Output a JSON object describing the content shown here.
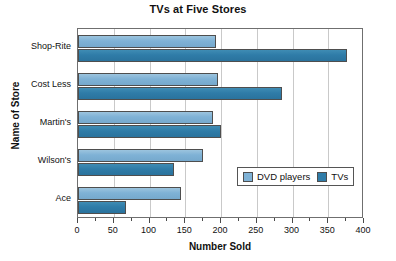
{
  "chart_data": {
    "type": "bar",
    "orientation": "horizontal",
    "title": "TVs at Five Stores",
    "xlabel": "Number Sold",
    "ylabel": "Name of Store",
    "categories": [
      "Shop-Rite",
      "Cost Less",
      "Martin's",
      "Wilson's",
      "Ace"
    ],
    "series": [
      {
        "name": "DVD players",
        "color": "#7FB2D6",
        "values": [
          193,
          196,
          189,
          175,
          144
        ]
      },
      {
        "name": "TVs",
        "color": "#2F7CA8",
        "values": [
          376,
          285,
          200,
          134,
          67
        ]
      }
    ],
    "xlim": [
      0,
      400
    ],
    "xticks": [
      0,
      50,
      100,
      150,
      200,
      250,
      300,
      350,
      400
    ],
    "xtick_labels": [
      "0",
      "50",
      "100",
      "150",
      "200",
      "250",
      "300",
      "350",
      "400"
    ],
    "grid": "vertical",
    "legend_position": "inside-lower-right"
  },
  "legend": {
    "items": [
      {
        "label": "DVD players",
        "color": "#7FB2D6"
      },
      {
        "label": "TVs",
        "color": "#2F7CA8"
      }
    ]
  }
}
